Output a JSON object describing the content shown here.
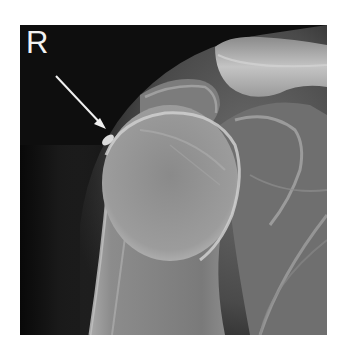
{
  "image": {
    "type": "radiograph",
    "view": "shoulder AP",
    "side_marker": "R",
    "annotation": {
      "type": "arrow",
      "color": "#f0f0f0",
      "points_to": "calcific deposit at greater tuberosity"
    },
    "colors": {
      "background": "#ffffff",
      "film": "#0b0b0b",
      "bone": "#c8c8c8"
    }
  }
}
